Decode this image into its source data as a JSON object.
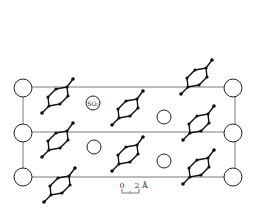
{
  "diagram": {
    "type": "crystal-structure-projection",
    "unit_cell": {
      "left": 23,
      "right": 235,
      "rows_y": [
        87,
        132,
        177
      ]
    },
    "corner_atoms": [
      {
        "x": 23,
        "y": 88,
        "r": 9
      },
      {
        "x": 23,
        "y": 133,
        "r": 9
      },
      {
        "x": 23,
        "y": 177,
        "r": 9
      },
      {
        "x": 233,
        "y": 88,
        "r": 9
      },
      {
        "x": 233,
        "y": 133,
        "r": 9
      },
      {
        "x": 233,
        "y": 177,
        "r": 9
      }
    ],
    "so2_molecules": [
      {
        "x": 93,
        "y": 103,
        "r": 7,
        "label": "SO₂"
      },
      {
        "x": 164,
        "y": 117,
        "r": 7,
        "label": ""
      },
      {
        "x": 94,
        "y": 147,
        "r": 7,
        "label": ""
      },
      {
        "x": 164,
        "y": 161,
        "r": 7,
        "label": ""
      }
    ],
    "organic_molecules": [
      {
        "x": 58,
        "y": 97
      },
      {
        "x": 128,
        "y": 109
      },
      {
        "x": 197,
        "y": 78
      },
      {
        "x": 199,
        "y": 124
      },
      {
        "x": 58,
        "y": 141
      },
      {
        "x": 128,
        "y": 155
      },
      {
        "x": 199,
        "y": 168
      },
      {
        "x": 60,
        "y": 186
      }
    ],
    "scale_bar": {
      "label_start": "0",
      "label_end": "2",
      "unit": "Å"
    }
  }
}
